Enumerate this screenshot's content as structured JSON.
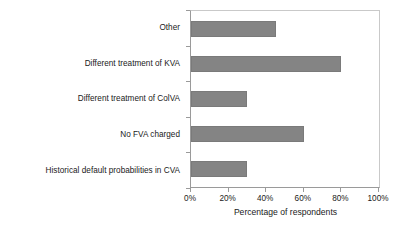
{
  "chart_data": {
    "type": "bar",
    "orientation": "horizontal",
    "title": "",
    "xlabel": "Percentage of respondents",
    "ylabel": "",
    "categories": [
      "Other",
      "Different treatment of KVA",
      "Different treatment of ColVA",
      "No FVA charged",
      "Historical default probabilities in CVA"
    ],
    "values": [
      45,
      80,
      30,
      60,
      30
    ],
    "value_suffix": "%",
    "xlim": [
      0,
      100
    ],
    "xticks": [
      0,
      20,
      40,
      60,
      80,
      100
    ],
    "xtick_labels": [
      "0%",
      "20%",
      "40%",
      "60%",
      "80%",
      "100%"
    ],
    "grid": false,
    "legend": null,
    "bar_color": "#848484",
    "axis_color": "#9a9a9a",
    "text_color": "#1a1a1a"
  }
}
